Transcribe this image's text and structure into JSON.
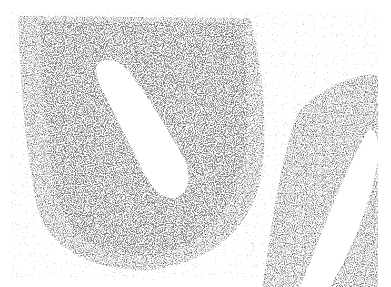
{
  "image": {
    "kind": "histology micrograph",
    "description": "Grayscale light micrograph of tissue cross-section showing a large ovoid epithelial structure with a central lumen and a second curved tubular structure with lumen at right",
    "colors": {
      "background": "#ffffff",
      "tissue_dark": "#3a3a3a",
      "tissue_mid": "#7a7a7a",
      "stroma": "#d8d8d8"
    }
  }
}
